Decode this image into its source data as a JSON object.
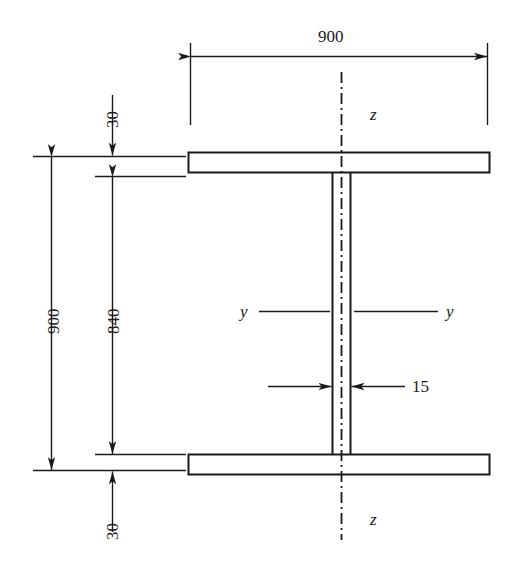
{
  "figure": {
    "kind": "engineering-cross-section-drawing",
    "background_color": "#ffffff",
    "line_color": "#1a1a1a"
  },
  "dimensions": {
    "overall_width": "900",
    "overall_depth": "900",
    "web_depth": "840",
    "top_flange_thickness": "30",
    "bottom_flange_thickness": "30",
    "web_thickness": "15"
  },
  "axis_labels": {
    "z_top": "z",
    "z_bottom": "z",
    "y_left": "y",
    "y_right": "y"
  },
  "labels": {
    "width_900": "900",
    "depth_900": "900",
    "web_840": "840",
    "flange_top_30": "30",
    "flange_bottom_30": "30",
    "web_15": "15"
  }
}
